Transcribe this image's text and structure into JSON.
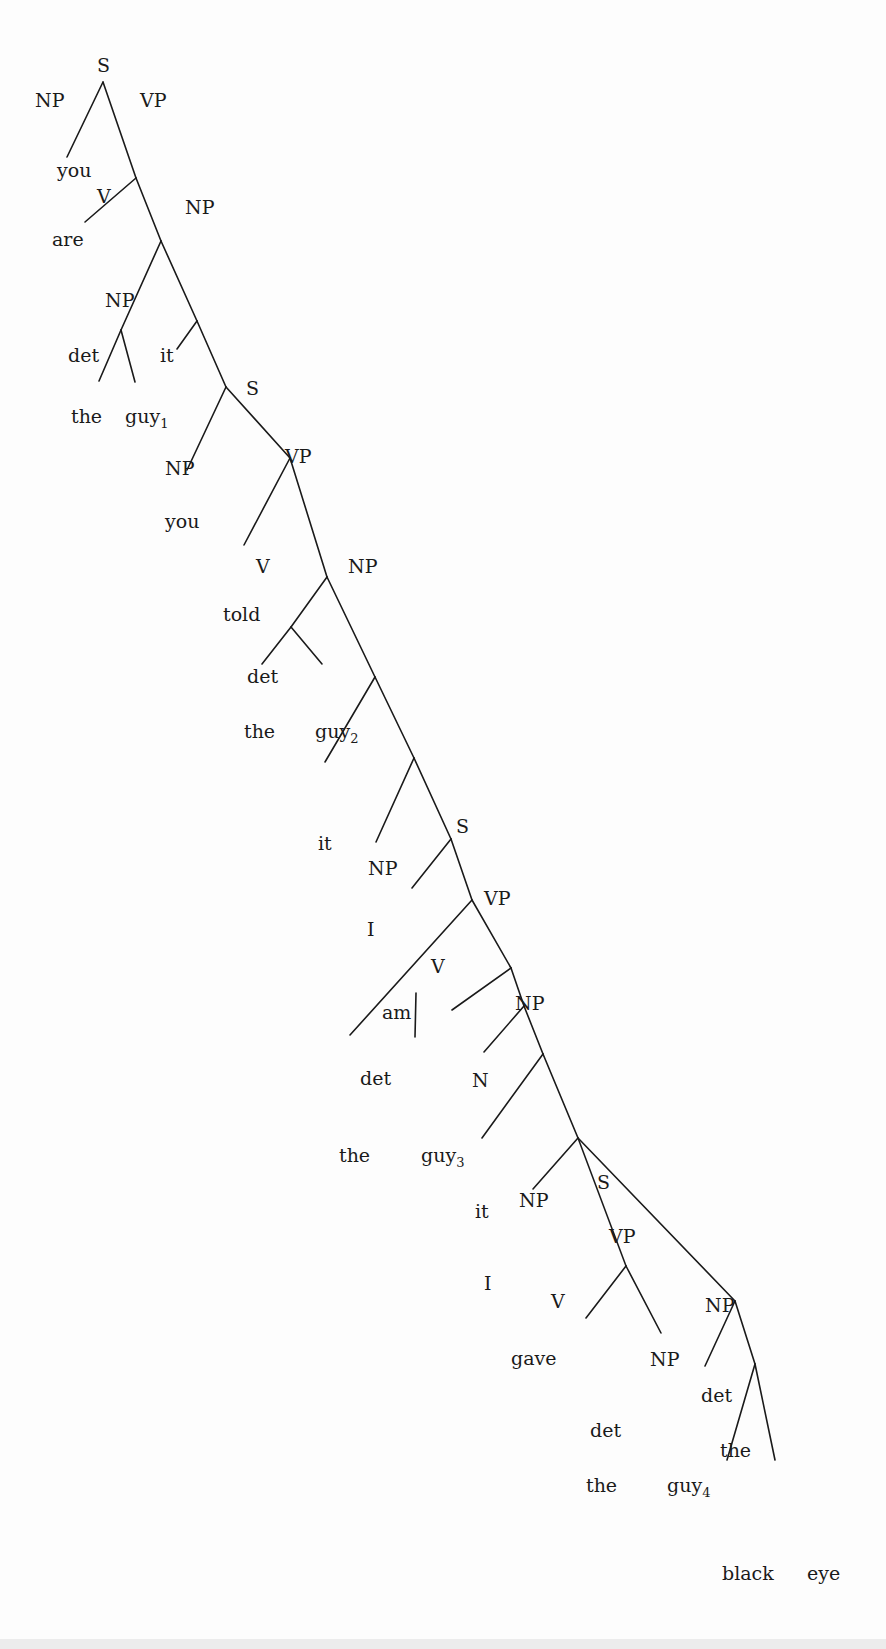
{
  "diagram": {
    "type": "syntax-tree",
    "sentence": "you are the guy it you told the guy it I am the guy it I gave the guy the black eye",
    "edges": [
      [
        103,
        82,
        67,
        157
      ],
      [
        103,
        82,
        136,
        178
      ],
      [
        136,
        178,
        85,
        222
      ],
      [
        136,
        178,
        161,
        241
      ],
      [
        161,
        241,
        121,
        330
      ],
      [
        161,
        241,
        197,
        321
      ],
      [
        121,
        330,
        99,
        381
      ],
      [
        121,
        330,
        135,
        382
      ],
      [
        197,
        321,
        177,
        349
      ],
      [
        197,
        321,
        226,
        387
      ],
      [
        226,
        387,
        187,
        470
      ],
      [
        226,
        387,
        290,
        458
      ],
      [
        290,
        458,
        244,
        545
      ],
      [
        290,
        458,
        327,
        577
      ],
      [
        327,
        577,
        291,
        627
      ],
      [
        327,
        577,
        375,
        677
      ],
      [
        291,
        627,
        262,
        664
      ],
      [
        291,
        627,
        322,
        664
      ],
      [
        375,
        677,
        325,
        762
      ],
      [
        375,
        677,
        414,
        758
      ],
      [
        414,
        758,
        376,
        842
      ],
      [
        414,
        758,
        451,
        839
      ],
      [
        451,
        839,
        412,
        888
      ],
      [
        451,
        839,
        472,
        900
      ],
      [
        472,
        900,
        350,
        1035
      ],
      [
        472,
        900,
        511,
        968
      ],
      [
        416,
        993,
        415,
        1037
      ],
      [
        511,
        968,
        452,
        1010
      ],
      [
        511,
        968,
        524,
        1006
      ],
      [
        524,
        1006,
        484,
        1052
      ],
      [
        524,
        1006,
        543,
        1054
      ],
      [
        543,
        1054,
        482,
        1138
      ],
      [
        543,
        1054,
        578,
        1138
      ],
      [
        578,
        1138,
        533,
        1189
      ],
      [
        578,
        1138,
        626,
        1266
      ],
      [
        578,
        1138,
        735,
        1301
      ],
      [
        626,
        1266,
        586,
        1318
      ],
      [
        626,
        1266,
        661,
        1333
      ],
      [
        735,
        1301,
        705,
        1366
      ],
      [
        735,
        1301,
        755,
        1364
      ],
      [
        755,
        1364,
        727,
        1460
      ],
      [
        755,
        1364,
        775,
        1460
      ]
    ],
    "labels": [
      {
        "t": "S",
        "x": 97,
        "y": 72,
        "role": "category"
      },
      {
        "t": "NP",
        "x": 35,
        "y": 107,
        "role": "category"
      },
      {
        "t": "VP",
        "x": 140,
        "y": 107,
        "role": "category"
      },
      {
        "t": "you",
        "x": 57,
        "y": 177,
        "role": "word"
      },
      {
        "t": "V",
        "x": 97,
        "y": 203,
        "role": "category"
      },
      {
        "t": "NP",
        "x": 185,
        "y": 214,
        "role": "category"
      },
      {
        "t": "are",
        "x": 52,
        "y": 246,
        "role": "word"
      },
      {
        "t": "NP",
        "x": 105,
        "y": 307,
        "role": "category"
      },
      {
        "t": "det",
        "x": 68,
        "y": 362,
        "role": "category"
      },
      {
        "t": "it",
        "x": 160,
        "y": 362,
        "role": "word"
      },
      {
        "t": "S",
        "x": 246,
        "y": 395,
        "role": "category"
      },
      {
        "t": "the",
        "x": 71,
        "y": 423,
        "role": "word"
      },
      {
        "t": "guy",
        "x": 125,
        "y": 423,
        "sub": "1",
        "role": "word"
      },
      {
        "t": "NP",
        "x": 165,
        "y": 475,
        "role": "category"
      },
      {
        "t": "VP",
        "x": 285,
        "y": 463,
        "role": "category"
      },
      {
        "t": "you",
        "x": 165,
        "y": 528,
        "role": "word"
      },
      {
        "t": "V",
        "x": 256,
        "y": 573,
        "role": "category"
      },
      {
        "t": "NP",
        "x": 348,
        "y": 573,
        "role": "category"
      },
      {
        "t": "told",
        "x": 223,
        "y": 621,
        "role": "word"
      },
      {
        "t": "det",
        "x": 247,
        "y": 683,
        "role": "category"
      },
      {
        "t": "the",
        "x": 244,
        "y": 738,
        "role": "word"
      },
      {
        "t": "guy",
        "x": 315,
        "y": 738,
        "sub": "2",
        "role": "word"
      },
      {
        "t": "it",
        "x": 318,
        "y": 850,
        "role": "word"
      },
      {
        "t": "S",
        "x": 456,
        "y": 833,
        "role": "category"
      },
      {
        "t": "NP",
        "x": 368,
        "y": 875,
        "role": "category"
      },
      {
        "t": "VP",
        "x": 484,
        "y": 905,
        "role": "category"
      },
      {
        "t": "I",
        "x": 367,
        "y": 936,
        "role": "word"
      },
      {
        "t": "V",
        "x": 431,
        "y": 973,
        "role": "category"
      },
      {
        "t": "NP",
        "x": 515,
        "y": 1010,
        "role": "category"
      },
      {
        "t": "am",
        "x": 382,
        "y": 1019,
        "role": "word"
      },
      {
        "t": "det",
        "x": 360,
        "y": 1085,
        "role": "category"
      },
      {
        "t": "N",
        "x": 472,
        "y": 1087,
        "role": "category"
      },
      {
        "t": "the",
        "x": 339,
        "y": 1162,
        "role": "word"
      },
      {
        "t": "guy",
        "x": 421,
        "y": 1162,
        "sub": "3",
        "role": "word"
      },
      {
        "t": "it",
        "x": 475,
        "y": 1218,
        "role": "word"
      },
      {
        "t": "NP",
        "x": 519,
        "y": 1207,
        "role": "category"
      },
      {
        "t": "S",
        "x": 597,
        "y": 1189,
        "role": "category"
      },
      {
        "t": "VP",
        "x": 609,
        "y": 1243,
        "role": "category"
      },
      {
        "t": "I",
        "x": 484,
        "y": 1290,
        "role": "word"
      },
      {
        "t": "V",
        "x": 551,
        "y": 1308,
        "role": "category"
      },
      {
        "t": "NP",
        "x": 705,
        "y": 1312,
        "role": "category"
      },
      {
        "t": "gave",
        "x": 511,
        "y": 1365,
        "role": "word"
      },
      {
        "t": "NP",
        "x": 650,
        "y": 1366,
        "role": "category"
      },
      {
        "t": "det",
        "x": 701,
        "y": 1402,
        "role": "category"
      },
      {
        "t": "det",
        "x": 590,
        "y": 1437,
        "role": "category"
      },
      {
        "t": "the",
        "x": 720,
        "y": 1457,
        "role": "word"
      },
      {
        "t": "the",
        "x": 586,
        "y": 1492,
        "role": "word"
      },
      {
        "t": "guy",
        "x": 667,
        "y": 1492,
        "sub": "4",
        "role": "word"
      },
      {
        "t": "black",
        "x": 722,
        "y": 1580,
        "role": "word"
      },
      {
        "t": "eye",
        "x": 807,
        "y": 1580,
        "role": "word"
      }
    ]
  }
}
